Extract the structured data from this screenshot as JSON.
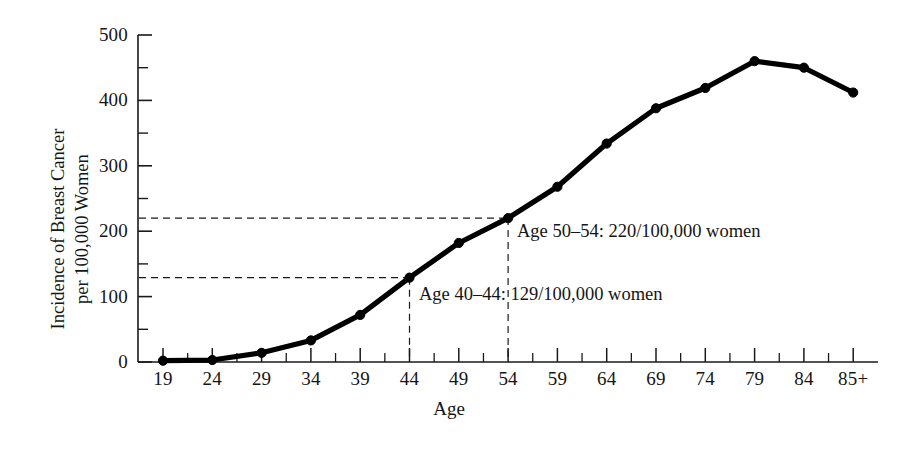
{
  "chart_data": {
    "type": "line",
    "title": "",
    "xlabel": "Age",
    "ylabel": "Incidence of Breast Cancer per 100,000 Women",
    "ylabel_lines": [
      "Incidence of Breast Cancer",
      "per 100,000 Women"
    ],
    "categories": [
      "19",
      "24",
      "29",
      "34",
      "39",
      "44",
      "49",
      "54",
      "59",
      "64",
      "69",
      "74",
      "79",
      "84",
      "85+"
    ],
    "values": [
      2,
      3,
      14,
      33,
      72,
      129,
      182,
      220,
      268,
      334,
      388,
      419,
      460,
      450,
      412
    ],
    "series": [
      {
        "name": "Incidence of Breast Cancer per 100,000 Women",
        "values": [
          2,
          3,
          14,
          33,
          72,
          129,
          182,
          220,
          268,
          334,
          388,
          419,
          460,
          450,
          412
        ],
        "color": "#000000",
        "marker": "circle"
      }
    ],
    "ylim": [
      0,
      500
    ],
    "yticks": [
      0,
      100,
      200,
      300,
      400,
      500
    ],
    "ytick_labels": [
      "0",
      "100",
      "200",
      "300",
      "400",
      "500"
    ],
    "yminor_step": 50,
    "xtick_labels": [
      "19",
      "24",
      "29",
      "34",
      "39",
      "44",
      "49",
      "54",
      "59",
      "64",
      "69",
      "74",
      "79",
      "84",
      "85+"
    ],
    "grid": false,
    "legend": "none",
    "annotations": [
      {
        "text": "Age 50–54: 220/100,000 women",
        "category": "54",
        "value": 220,
        "guide_x": true,
        "guide_y": true
      },
      {
        "text": "Age 40–44: 129/100,000 women",
        "category": "44",
        "value": 129,
        "guide_x": true,
        "guide_y": true
      }
    ]
  },
  "axes": {
    "y_title_line1": "Incidence of Breast Cancer",
    "y_title_line2": "per 100,000 Women",
    "x_title": "Age"
  }
}
